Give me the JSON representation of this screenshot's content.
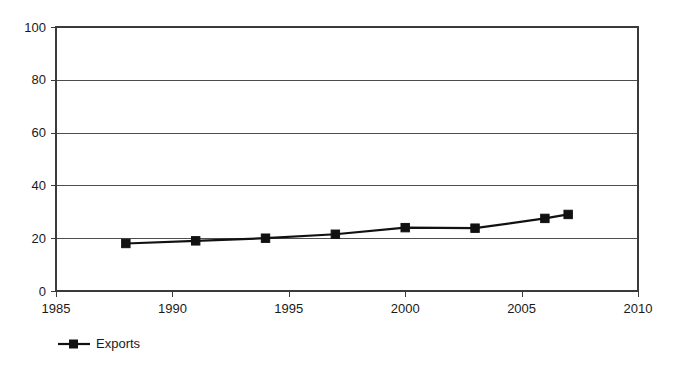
{
  "chart_data": {
    "type": "line",
    "title": "",
    "subtitle": "",
    "xlabel": "",
    "ylabel": "",
    "xlim": [
      1985,
      2010
    ],
    "ylim": [
      0,
      100
    ],
    "grid": true,
    "legend_position": "bottom-left",
    "x_ticks": [
      1985,
      1990,
      1995,
      2000,
      2005,
      2010
    ],
    "x_tick_labels": [
      "1985",
      "1990",
      "1995",
      "2000",
      "2005",
      "2010"
    ],
    "y_ticks": [
      0,
      20,
      40,
      60,
      80,
      100
    ],
    "y_tick_labels": [
      "0",
      "20",
      "40",
      "60",
      "80",
      "100"
    ],
    "series": [
      {
        "name": "Exports",
        "marker": "square",
        "color": "#111111",
        "x": [
          1988,
          1991,
          1994,
          1997,
          2000,
          2003,
          2006,
          2007
        ],
        "values": [
          18,
          19,
          20,
          21.5,
          24,
          23.8,
          27.5,
          29
        ]
      }
    ]
  },
  "legend": {
    "entries": [
      {
        "label": "Exports"
      }
    ]
  },
  "axes": {
    "y_axis_name": "value-axis",
    "x_axis_name": "year-axis"
  }
}
